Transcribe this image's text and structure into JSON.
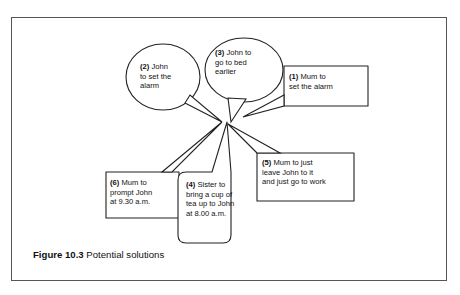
{
  "figure": {
    "caption_label": "Figure 10.3",
    "caption_text": "Potential solutions"
  },
  "diagram": {
    "center_label": "convergence-point",
    "nodes": [
      {
        "id": "1",
        "shape": "rectangle",
        "number": "(1)",
        "text": "Mum to\nset the alarm",
        "full_text": "(1) Mum to set the alarm"
      },
      {
        "id": "2",
        "shape": "ellipse",
        "number": "(2)",
        "text": "John\nto set the\nalarm",
        "full_text": "(2) John to set the alarm"
      },
      {
        "id": "3",
        "shape": "ellipse",
        "number": "(3)",
        "text": "John to\ngo to bed\nearlier",
        "full_text": "(3) John to go to bed earlier"
      },
      {
        "id": "4",
        "shape": "rounded-rectangle",
        "number": "(4)",
        "text": "Sister to\nbring a cup of\ntea up to John\nat 8.00 a.m.",
        "full_text": "(4) Sister to bring a cup of tea up to John at 8.00 a.m."
      },
      {
        "id": "5",
        "shape": "rectangle",
        "number": "(5)",
        "text": "Mum to just\nleave John to it\nand just go to work",
        "full_text": "(5) Mum to just leave John to it and just go to work"
      },
      {
        "id": "6",
        "shape": "rectangle",
        "number": "(6)",
        "text": "Mum to\nprompt John\nat 9.30 a.m.",
        "full_text": "(6) Mum to prompt John at 9.30 a.m."
      }
    ]
  },
  "colors": {
    "background": "#ffffff",
    "frame_border": "#555555",
    "shape_stroke": "#222222",
    "text": "#111111"
  }
}
